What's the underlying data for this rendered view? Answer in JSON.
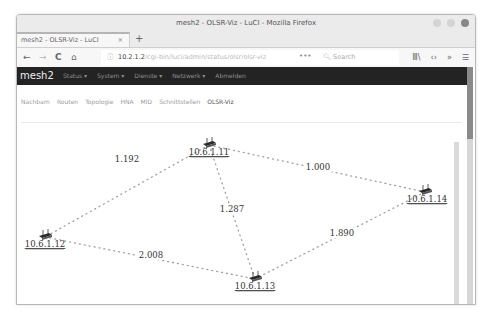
{
  "window": {
    "title": "mesh2 - OLSR-Viz - LuCI - Mozilla Firefox",
    "tab_label": "mesh2 - OLSR-Viz - LuCI",
    "tab_close": "×",
    "new_tab": "+"
  },
  "navbar": {
    "back": "←",
    "forward": "→",
    "reload": "C",
    "home": "⌂",
    "info": "ⓘ",
    "url_host": "10.2.1.2",
    "url_path": "/cgi-bin/luci/admin/status/olsr/olsr-viz",
    "page_actions": "•••",
    "search_placeholder": "Search",
    "library": "Ⅲ\\",
    "devtools": "‹›",
    "overflow": "»",
    "menu": "☰"
  },
  "luci": {
    "brand": "mesh2",
    "menu": [
      "Status ▾",
      "System ▾",
      "Dienste ▾",
      "Netzwerk ▾",
      "Abmelden"
    ],
    "subtabs": [
      "Nachbarn",
      "Routen",
      "Topologie",
      "HNA",
      "MID",
      "Schnittstellen",
      "OLSR-Viz"
    ],
    "active_subtab": "OLSR-Viz"
  },
  "topology": {
    "nodes": [
      {
        "id": "n11",
        "label": "10.6.1.11"
      },
      {
        "id": "n12",
        "label": "10.6.1.12"
      },
      {
        "id": "n13",
        "label": "10.6.1.13"
      },
      {
        "id": "n14",
        "label": "10.6.1.14"
      }
    ],
    "links": [
      {
        "from": "n11",
        "to": "n12",
        "etx": "1.192"
      },
      {
        "from": "n11",
        "to": "n13",
        "etx": "1.287"
      },
      {
        "from": "n11",
        "to": "n14",
        "etx": "1.000"
      },
      {
        "from": "n12",
        "to": "n13",
        "etx": "2.008"
      },
      {
        "from": "n13",
        "to": "n14",
        "etx": "1.890"
      }
    ]
  }
}
